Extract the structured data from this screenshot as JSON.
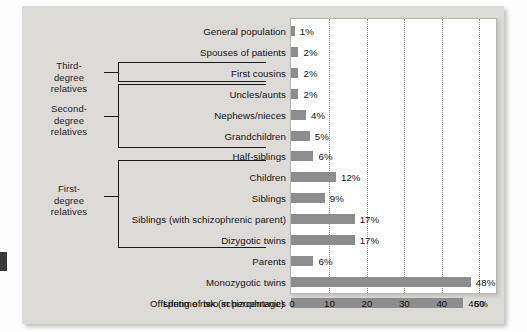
{
  "figure": {
    "background_color": "#dedcd9",
    "plot_background_color": "#ffffff",
    "bar_color": "#8d8d8d",
    "text_color": "#141414"
  },
  "group_brackets": [
    {
      "name": "third-degree",
      "label": "Third-\ndegree\nrelatives"
    },
    {
      "name": "second-degree",
      "label": "Second-\ndegree\nrelatives"
    },
    {
      "name": "first-degree",
      "label": "First-\ndegree\nrelatives"
    }
  ],
  "chart_data": {
    "type": "bar",
    "orientation": "horizontal",
    "title": "",
    "xlabel": "Lifetime risk (in percentage)",
    "ylabel": "",
    "xlim": [
      0,
      55
    ],
    "x_ticks": [
      0,
      10,
      20,
      30,
      40,
      50
    ],
    "x_tick_labels": [
      "0",
      "10",
      "20",
      "30",
      "40",
      "50"
    ],
    "grid": "vertical dotted gridlines at each x tick",
    "legend": "none",
    "value_label_suffix": "%",
    "categories": [
      "General population",
      "Spouses of patients",
      "First cousins",
      "Uncles/aunts",
      "Nephews/nieces",
      "Grandchildren",
      "Half-siblings",
      "Children",
      "Siblings",
      "Siblings (with schizophrenic parent)",
      "Dizygotic twins",
      "Parents",
      "Monozygotic twins",
      "Offspring of two schizophrenics"
    ],
    "values": [
      1,
      2,
      2,
      2,
      4,
      5,
      6,
      12,
      9,
      17,
      17,
      6,
      48,
      46
    ],
    "value_labels": [
      "1%",
      "2%",
      "2%",
      "2%",
      "4%",
      "5%",
      "6%",
      "12%",
      "9%",
      "17%",
      "17%",
      "6%",
      "48%",
      "46%"
    ],
    "groups": {
      "third-degree relatives": [
        "First cousins"
      ],
      "second-degree relatives": [
        "Uncles/aunts",
        "Nephews/nieces",
        "Grandchildren",
        "Half-siblings"
      ],
      "first-degree relatives": [
        "Children",
        "Siblings",
        "Siblings (with schizophrenic parent)",
        "Dizygotic twins",
        "Parents"
      ]
    }
  }
}
